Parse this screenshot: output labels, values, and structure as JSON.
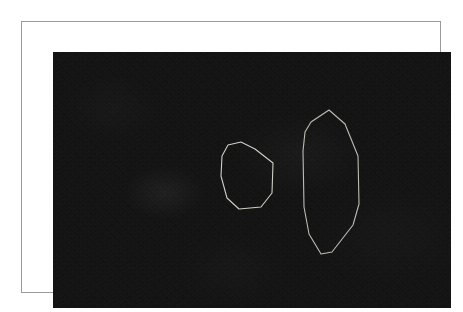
{
  "page": {
    "background_color": "#ffffff",
    "width": 463,
    "height": 312
  },
  "frame": {
    "border_color": "#9a9a9a",
    "border_width": 1,
    "matte_color": "#ffffff",
    "x": 21,
    "y": 21,
    "width": 420,
    "height": 272
  },
  "image_canvas": {
    "background_color": "#0b0b0b",
    "x": 31,
    "y": 30,
    "width": 398,
    "height": 256,
    "description": "dark low-light grainy photograph"
  },
  "annotations": {
    "stroke_color": "#c8c8c0",
    "stroke_width": 1.1,
    "shapes": [
      {
        "name": "roi-polygon-small",
        "label": "",
        "type": "polygon",
        "vertex_count": 8,
        "stroke": "#cfcfc7",
        "points": "175,93 188,90 202,97 220,111 219,141 208,155 186,157 174,146 168,124 169,104"
      },
      {
        "name": "roi-polygon-large",
        "label": "",
        "type": "polygon",
        "vertex_count": 8,
        "stroke": "#bdbdb5",
        "points": "276,58 292,72 305,104 306,152 300,173 279,200 268,202 256,182 251,155 250,99 252,80 258,70"
      }
    ]
  },
  "caption": {
    "text": ""
  }
}
